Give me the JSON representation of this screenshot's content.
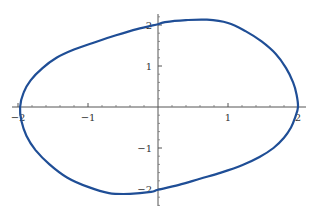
{
  "chart_data": {
    "type": "line",
    "subtype": "parametric closed curve",
    "title": "",
    "xlabel": "",
    "ylabel": "",
    "xlim": [
      -2.1,
      2.1
    ],
    "ylim": [
      -2.35,
      2.3
    ],
    "grid": false,
    "legend": null,
    "axes_through_origin": true,
    "x_ticks": [
      -2,
      -1,
      1,
      2
    ],
    "x_tick_labels": [
      "-2",
      "-1",
      "1",
      "2"
    ],
    "y_ticks": [
      -2,
      -1,
      1,
      2
    ],
    "y_tick_labels": [
      "-2",
      "-1",
      "1",
      "2"
    ],
    "minor_ticks_per_unit": 5,
    "series": [
      {
        "name": "closed curve",
        "color": "#1f4e96",
        "points": [
          [
            2.0,
            0.0
          ],
          [
            1.98,
            0.3
          ],
          [
            1.93,
            0.6
          ],
          [
            1.83,
            0.95
          ],
          [
            1.68,
            1.3
          ],
          [
            1.48,
            1.6
          ],
          [
            1.25,
            1.85
          ],
          [
            1.0,
            2.05
          ],
          [
            0.7,
            2.13
          ],
          [
            0.4,
            2.12
          ],
          [
            0.1,
            2.07
          ],
          [
            0.0,
            2.02
          ],
          [
            -0.3,
            1.9
          ],
          [
            -0.6,
            1.75
          ],
          [
            -0.9,
            1.58
          ],
          [
            -1.2,
            1.4
          ],
          [
            -1.45,
            1.2
          ],
          [
            -1.65,
            0.95
          ],
          [
            -1.82,
            0.65
          ],
          [
            -1.92,
            0.35
          ],
          [
            -1.97,
            0.0
          ],
          [
            -1.95,
            -0.35
          ],
          [
            -1.88,
            -0.7
          ],
          [
            -1.75,
            -1.05
          ],
          [
            -1.55,
            -1.4
          ],
          [
            -1.3,
            -1.72
          ],
          [
            -1.0,
            -1.95
          ],
          [
            -0.7,
            -2.1
          ],
          [
            -0.4,
            -2.12
          ],
          [
            -0.1,
            -2.07
          ],
          [
            0.0,
            -2.02
          ],
          [
            0.3,
            -1.9
          ],
          [
            0.6,
            -1.75
          ],
          [
            0.9,
            -1.6
          ],
          [
            1.2,
            -1.42
          ],
          [
            1.45,
            -1.22
          ],
          [
            1.65,
            -1.0
          ],
          [
            1.8,
            -0.75
          ],
          [
            1.9,
            -0.5
          ],
          [
            1.96,
            -0.25
          ],
          [
            2.0,
            0.0
          ]
        ]
      }
    ]
  },
  "plot": {
    "axis_color": "#555555",
    "curve_color": "#1f4e96"
  }
}
